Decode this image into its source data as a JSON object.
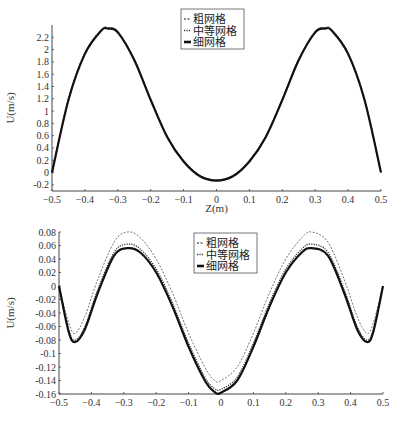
{
  "chart_data": [
    {
      "type": "line",
      "title": "",
      "xlabel": "Z(m)",
      "ylabel": "U(m/s)",
      "xlim": [
        -0.5,
        0.5
      ],
      "ylim": [
        -0.3,
        2.4
      ],
      "xticks": [
        "-0.5",
        "-0.4",
        "-0.3",
        "-0.2",
        "-0.1",
        "0",
        "0.1",
        "0.2",
        "0.3",
        "0.4",
        "0.5"
      ],
      "yticks": [
        "-0.2",
        "0",
        "0.2",
        "0.4",
        "0.6",
        "0.8",
        "1",
        "1.2",
        "1.4",
        "1.6",
        "1.8",
        "2",
        "2.2"
      ],
      "grid": false,
      "legend_position": "upper center",
      "legend": [
        "粗网格",
        "中等网格",
        "细网格"
      ],
      "x": [
        -0.5,
        -0.45,
        -0.4,
        -0.35,
        -0.33,
        -0.3,
        -0.25,
        -0.2,
        -0.15,
        -0.1,
        -0.05,
        0,
        0.05,
        0.1,
        0.15,
        0.2,
        0.25,
        0.3,
        0.33,
        0.35,
        0.4,
        0.45,
        0.5
      ],
      "series": [
        {
          "name": "粗网格",
          "style": "dashed",
          "values": [
            0,
            1.2,
            1.95,
            2.33,
            2.36,
            2.3,
            1.85,
            1.2,
            0.6,
            0.2,
            -0.05,
            -0.12,
            -0.05,
            0.2,
            0.6,
            1.2,
            1.85,
            2.3,
            2.36,
            2.33,
            1.95,
            1.2,
            0
          ]
        },
        {
          "name": "中等网格",
          "style": "dotted",
          "values": [
            0,
            1.19,
            1.94,
            2.32,
            2.35,
            2.29,
            1.84,
            1.19,
            0.59,
            0.19,
            -0.05,
            -0.12,
            -0.05,
            0.19,
            0.59,
            1.19,
            1.84,
            2.29,
            2.35,
            2.32,
            1.94,
            1.19,
            0
          ]
        },
        {
          "name": "细网格",
          "style": "solid",
          "values": [
            0,
            1.18,
            1.93,
            2.31,
            2.34,
            2.28,
            1.83,
            1.18,
            0.58,
            0.18,
            -0.06,
            -0.13,
            -0.06,
            0.18,
            0.58,
            1.18,
            1.83,
            2.28,
            2.34,
            2.31,
            1.93,
            1.18,
            0
          ]
        }
      ]
    },
    {
      "type": "line",
      "title": "",
      "xlabel": "",
      "ylabel": "U(m/s)",
      "xlim": [
        -0.5,
        0.5
      ],
      "ylim": [
        -0.16,
        0.08
      ],
      "xticks": [
        "-0.5",
        "-0.4",
        "-0.3",
        "-0.2",
        "-0.1",
        "0",
        "0.1",
        "0.2",
        "0.3",
        "0.4",
        "0.5"
      ],
      "yticks": [
        "0.08",
        "0.06",
        "0.04",
        "0.02",
        "0",
        "-0.02",
        "-0.04",
        "-0.06",
        "-0.08",
        "-0.1",
        "-0.12",
        "-0.14",
        "-0.16"
      ],
      "grid": false,
      "legend_position": "upper center",
      "legend": [
        "粗网格",
        "中等网格",
        "细网格"
      ],
      "x": [
        -0.5,
        -0.47,
        -0.45,
        -0.42,
        -0.38,
        -0.33,
        -0.29,
        -0.25,
        -0.2,
        -0.15,
        -0.1,
        -0.05,
        -0.02,
        0,
        0.05,
        0.1,
        0.15,
        0.2,
        0.25,
        0.28,
        0.33,
        0.38,
        0.42,
        0.45,
        0.47,
        0.5
      ],
      "series": [
        {
          "name": "粗网格",
          "style": "dashed",
          "values": [
            0,
            -0.055,
            -0.07,
            -0.045,
            0.01,
            0.065,
            0.08,
            0.072,
            0.04,
            -0.01,
            -0.07,
            -0.12,
            -0.14,
            -0.14,
            -0.12,
            -0.07,
            -0.01,
            0.04,
            0.072,
            0.08,
            0.065,
            0.01,
            -0.045,
            -0.07,
            -0.055,
            0
          ]
        },
        {
          "name": "中等网格",
          "style": "dotted",
          "values": [
            0,
            -0.065,
            -0.08,
            -0.06,
            -0.005,
            0.05,
            0.062,
            0.055,
            0.025,
            -0.025,
            -0.085,
            -0.135,
            -0.152,
            -0.153,
            -0.135,
            -0.085,
            -0.025,
            0.025,
            0.055,
            0.062,
            0.05,
            -0.005,
            -0.06,
            -0.08,
            -0.065,
            0
          ]
        },
        {
          "name": "细网格",
          "style": "solid",
          "values": [
            0,
            -0.068,
            -0.083,
            -0.064,
            -0.01,
            0.045,
            0.056,
            0.05,
            0.02,
            -0.03,
            -0.09,
            -0.14,
            -0.157,
            -0.158,
            -0.14,
            -0.09,
            -0.03,
            0.02,
            0.05,
            0.056,
            0.045,
            -0.01,
            -0.064,
            -0.083,
            -0.068,
            0
          ]
        }
      ]
    }
  ]
}
